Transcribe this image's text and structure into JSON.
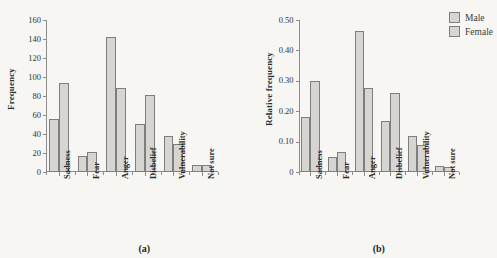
{
  "figure": {
    "legend": {
      "position": "top-right",
      "entries": [
        {
          "label": "Male",
          "color": "#d6d5d2"
        },
        {
          "label": "Female",
          "color": "#d6d5d2"
        }
      ]
    },
    "panels": [
      {
        "key": "a",
        "caption": "(a)"
      },
      {
        "key": "b",
        "caption": "(b)"
      }
    ]
  },
  "chart_data": [
    {
      "type": "bar",
      "panel": "(a)",
      "title": "",
      "xlabel": "",
      "ylabel": "Frequency",
      "categories": [
        "Sadness",
        "Fear",
        "Anger",
        "Disbelief",
        "Vulnerability",
        "Not sure"
      ],
      "series": [
        {
          "name": "Male",
          "values": [
            56,
            17,
            142,
            51,
            38,
            7
          ]
        },
        {
          "name": "Female",
          "values": [
            94,
            21,
            88,
            81,
            30,
            7
          ]
        }
      ],
      "ylim": [
        0,
        160
      ],
      "yticks": [
        0,
        20,
        40,
        60,
        80,
        100,
        120,
        140,
        160
      ],
      "ytick_labels": [
        "0",
        "20",
        "40",
        "60",
        "80",
        "100",
        "120",
        "140",
        "160"
      ],
      "grid": false,
      "legend": "top-right-shared"
    },
    {
      "type": "bar",
      "panel": "(b)",
      "title": "",
      "xlabel": "",
      "ylabel": "Relative frequency",
      "categories": [
        "Sadness",
        "Fear",
        "Anger",
        "Disbelief",
        "Vulnerability",
        "Not sure"
      ],
      "series": [
        {
          "name": "Male",
          "values": [
            0.18,
            0.05,
            0.465,
            0.167,
            0.12,
            0.02
          ]
        },
        {
          "name": "Female",
          "values": [
            0.3,
            0.067,
            0.278,
            0.259,
            0.09,
            0.015
          ]
        }
      ],
      "ylim": [
        0,
        0.5
      ],
      "yticks": [
        0,
        0.1,
        0.2,
        0.3,
        0.4,
        0.5
      ],
      "ytick_labels": [
        "0",
        "0.10",
        "0.20",
        "0.30",
        "0.40",
        "0.50"
      ],
      "grid": false,
      "legend": "top-right-shared"
    }
  ]
}
